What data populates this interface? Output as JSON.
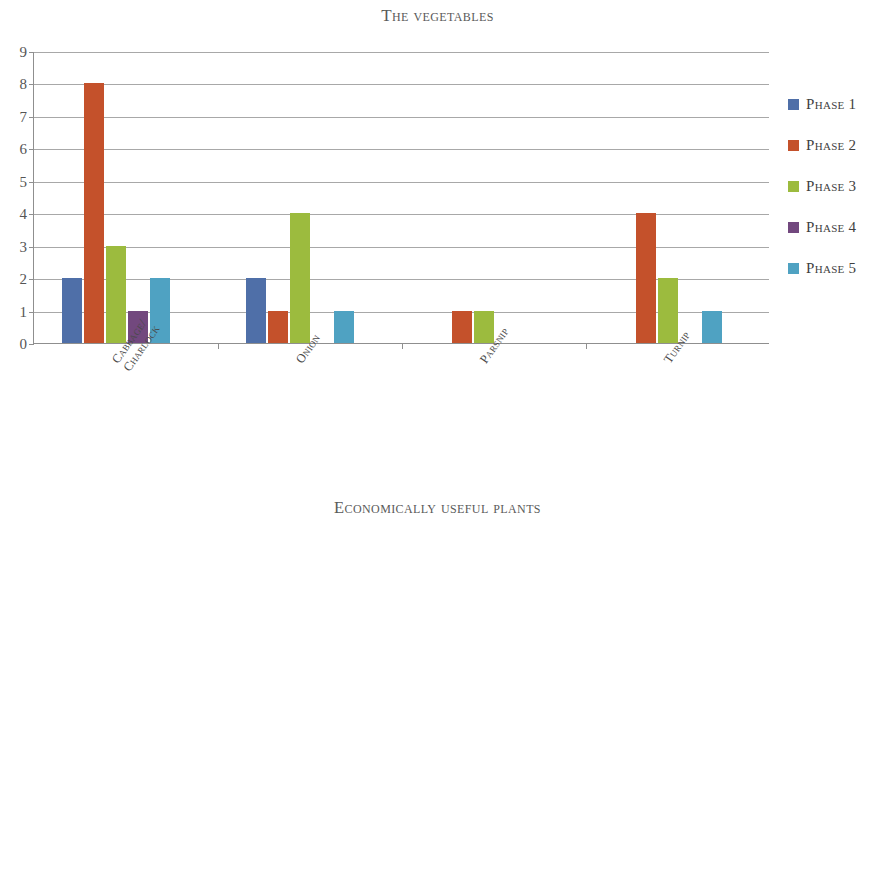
{
  "colors": {
    "phase1": "#4F6FA8",
    "phase2": "#C4512B",
    "phase3": "#9CBB3E",
    "phase4": "#72487E",
    "phase5": "#4FA2C2",
    "axis": "#8f8f8f",
    "grid": "#a8a8a8",
    "title": "#5a5a5a"
  },
  "legend": {
    "entries": [
      {
        "label": "Phase 1",
        "color": "#4F6FA8"
      },
      {
        "label": "Phase 2",
        "color": "#C4512B"
      },
      {
        "label": "Phase 3",
        "color": "#9CBB3E"
      },
      {
        "label": "Phase 4",
        "color": "#72487E"
      },
      {
        "label": "Phase 5",
        "color": "#4FA2C2"
      }
    ]
  },
  "chart_data": [
    {
      "id": "vegetables",
      "type": "bar",
      "title": "The vegetables",
      "xlabel": "",
      "ylabel": "",
      "ylim": [
        0,
        9
      ],
      "ytick_step": 1,
      "yticks": [
        "0",
        "1",
        "2",
        "3",
        "4",
        "5",
        "6",
        "7",
        "8",
        "9"
      ],
      "grid": true,
      "legend_position": "right",
      "categories": [
        "Cabbage/\nCharlock",
        "Onion",
        "Parsnip",
        "Turnip"
      ],
      "series": [
        {
          "name": "Phase 1",
          "color": "#4F6FA8",
          "values": [
            2,
            2,
            0,
            0
          ]
        },
        {
          "name": "Phase 2",
          "color": "#C4512B",
          "values": [
            8,
            1,
            1,
            4
          ]
        },
        {
          "name": "Phase 3",
          "color": "#9CBB3E",
          "values": [
            3,
            4,
            1,
            2
          ]
        },
        {
          "name": "Phase 4",
          "color": "#72487E",
          "values": [
            1,
            0,
            0,
            0
          ]
        },
        {
          "name": "Phase 5",
          "color": "#4FA2C2",
          "values": [
            2,
            1,
            0,
            1
          ]
        }
      ]
    },
    {
      "id": "economically-useful-plants",
      "type": "bar",
      "title": "Economically useful plants",
      "xlabel": "",
      "ylabel": "",
      "ylim": [
        0,
        16
      ],
      "ytick_step": 2,
      "yticks": [
        "0",
        "2",
        "4",
        "6",
        "8",
        "10",
        "12",
        "14",
        "16"
      ],
      "grid": true,
      "legend_position": "right",
      "categories": [
        "Braken",
        "Flax",
        "Heather",
        "Meadosweet",
        "Selfheal",
        "Rush",
        "Sedge",
        "Weld/Dyers\nRocket",
        "Woad"
      ],
      "series": [
        {
          "name": "Phase 1",
          "color": "#4F6FA8",
          "values": [
            7,
            0,
            3,
            0,
            1,
            3,
            12,
            0,
            0
          ]
        },
        {
          "name": "Phase 2",
          "color": "#C4512B",
          "values": [
            11,
            5,
            8,
            1,
            2,
            7,
            14,
            4,
            1
          ]
        },
        {
          "name": "Phase 3",
          "color": "#9CBB3E",
          "values": [
            4,
            2,
            5,
            0,
            1,
            4,
            7,
            0,
            0
          ]
        },
        {
          "name": "Phase 4",
          "color": "#72487E",
          "values": [
            1,
            0,
            3,
            0,
            3,
            1,
            3,
            1,
            0
          ]
        },
        {
          "name": "Phase 5",
          "color": "#4FA2C2",
          "values": [
            1,
            0,
            1,
            0,
            2,
            1,
            3,
            2,
            0
          ]
        }
      ]
    }
  ]
}
